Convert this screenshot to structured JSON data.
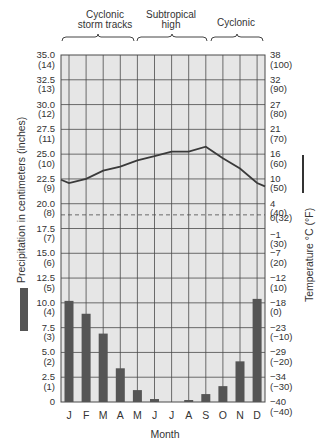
{
  "chart_data": {
    "type": "climograph",
    "title": "",
    "regimes": [
      {
        "label_line1": "Cyclonic",
        "label_line2": "storm tracks",
        "months": [
          "J",
          "F",
          "M",
          "A"
        ]
      },
      {
        "label_line1": "Subtropical",
        "label_line2": "high",
        "months": [
          "M",
          "J",
          "J",
          "A"
        ]
      },
      {
        "label_line1": "Cyclonic",
        "label_line2": "",
        "months": [
          "S",
          "O",
          "N",
          "D"
        ]
      }
    ],
    "categories": [
      "J",
      "F",
      "M",
      "A",
      "M",
      "J",
      "J",
      "A",
      "S",
      "O",
      "N",
      "D"
    ],
    "xlabel": "Month",
    "left_axis": {
      "label": "Precipitation in centimeters (inches)",
      "ylim": [
        0,
        35
      ],
      "ticks": [
        {
          "cm": "35.0",
          "in": "(14)"
        },
        {
          "cm": "32.5",
          "in": "(13)"
        },
        {
          "cm": "30.0",
          "in": "(12)"
        },
        {
          "cm": "27.5",
          "in": "(11)"
        },
        {
          "cm": "25.0",
          "in": "(10)"
        },
        {
          "cm": "22.5",
          "in": "(9)"
        },
        {
          "cm": "20.0",
          "in": "(8)"
        },
        {
          "cm": "17.5",
          "in": "(7)"
        },
        {
          "cm": "15.0",
          "in": "(6)"
        },
        {
          "cm": "12.5",
          "in": "(5)"
        },
        {
          "cm": "10.0",
          "in": "(4)"
        },
        {
          "cm": "7.5",
          "in": "(3)"
        },
        {
          "cm": "5.0",
          "in": "(2)"
        },
        {
          "cm": "2.5",
          "in": "(1)"
        },
        {
          "cm": "0",
          "in": ""
        }
      ]
    },
    "right_axis": {
      "label": "Temperature °C (°F)",
      "ylim_c": [
        -40,
        38
      ],
      "ticks": [
        {
          "c": "38",
          "f": "(100)"
        },
        {
          "c": "32",
          "f": "(90)"
        },
        {
          "c": "27",
          "f": "(80)"
        },
        {
          "c": "21",
          "f": "(70)"
        },
        {
          "c": "16",
          "f": "(60)"
        },
        {
          "c": "10",
          "f": "(50)"
        },
        {
          "c": "4",
          "f": "(40)"
        },
        {
          "c": "0(32)",
          "f": ""
        },
        {
          "c": "−1",
          "f": "(30)"
        },
        {
          "c": "−7",
          "f": "(20)"
        },
        {
          "c": "−12",
          "f": "(10)"
        },
        {
          "c": "−18",
          "f": "(0)"
        },
        {
          "c": "−23",
          "f": "(−10)"
        },
        {
          "c": "−29",
          "f": "(−20)"
        },
        {
          "c": "−34",
          "f": "(−30)"
        },
        {
          "c": "−40",
          "f": "(−40)"
        }
      ],
      "freezing_line_dashed": true
    },
    "series": [
      {
        "name": "Precipitation (cm)",
        "type": "bar",
        "values": [
          10.2,
          8.9,
          6.9,
          3.4,
          1.2,
          0.3,
          0.0,
          0.2,
          0.8,
          1.6,
          4.1,
          10.4
        ]
      },
      {
        "name": "Temperature (°C)",
        "type": "line",
        "values": [
          9,
          10,
          12,
          13,
          14.5,
          15.5,
          16.5,
          16.5,
          17.5,
          15,
          12.5,
          9
        ]
      }
    ],
    "legend": [
      {
        "label": "Precipitation",
        "symbol": "bar"
      },
      {
        "label": "Temperature",
        "symbol": "line"
      }
    ],
    "grid": true
  },
  "colors": {
    "plot_bg": "#e6e6e6",
    "grid": "#4a4a4a",
    "bar": "#555555",
    "line": "#3a3a3a"
  }
}
